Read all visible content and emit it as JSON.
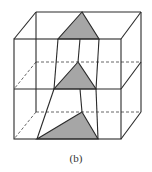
{
  "figure": {
    "label": "(b)",
    "colors": {
      "line": "#2a2a2a",
      "shade": "#a6a6a6",
      "background": "#ffffff"
    }
  },
  "diagram": {
    "front_box": {
      "left": 14,
      "right": 121,
      "top": 39,
      "middle": 89,
      "bottom": 139
    },
    "back_box": {
      "left": 36,
      "right": 141,
      "top": 12,
      "middle": 62,
      "bottom": 112
    },
    "triangles": [
      {
        "name": "top",
        "points": [
          [
            82,
            12
          ],
          [
            58,
            39
          ],
          [
            99,
            39
          ]
        ]
      },
      {
        "name": "middle",
        "points": [
          [
            78,
            62
          ],
          [
            54,
            89
          ],
          [
            96,
            89
          ]
        ]
      },
      {
        "name": "bottom",
        "points": [
          [
            82,
            112
          ],
          [
            37,
            139
          ],
          [
            98,
            139
          ]
        ]
      }
    ]
  }
}
